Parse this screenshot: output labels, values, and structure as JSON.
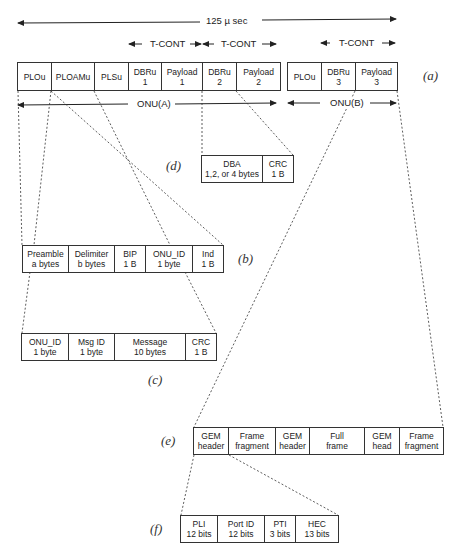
{
  "diagram": {
    "frame_duration_label": "125 µ sec",
    "tcont_label": "T-CONT",
    "onu_a_label": "ONU(A)",
    "onu_b_label": "ONU(B)",
    "parts": {
      "a": "(a)",
      "b": "(b)",
      "c": "(c)",
      "d": "(d)",
      "e": "(e)",
      "f": "(f)"
    },
    "row_a": {
      "onu_a_fields": [
        {
          "line1": "PLOu",
          "line2": ""
        },
        {
          "line1": "PLOAMu",
          "line2": ""
        },
        {
          "line1": "PLSu",
          "line2": ""
        },
        {
          "line1": "DBRu",
          "line2": "1"
        },
        {
          "line1": "Payload",
          "line2": "1"
        },
        {
          "line1": "DBRu",
          "line2": "2"
        },
        {
          "line1": "Payload",
          "line2": "2"
        }
      ],
      "onu_b_fields": [
        {
          "line1": "PLOu",
          "line2": ""
        },
        {
          "line1": "DBRu",
          "line2": "3"
        },
        {
          "line1": "Payload",
          "line2": "3"
        }
      ]
    },
    "row_b": [
      {
        "line1": "Preamble",
        "line2": "a bytes"
      },
      {
        "line1": "Delimiter",
        "line2": "b bytes"
      },
      {
        "line1": "BIP",
        "line2": "1 B"
      },
      {
        "line1": "ONU_ID",
        "line2": "1 byte"
      },
      {
        "line1": "Ind",
        "line2": "1 B"
      }
    ],
    "row_c": [
      {
        "line1": "ONU_ID",
        "line2": "1 byte"
      },
      {
        "line1": "Msg ID",
        "line2": "1 byte"
      },
      {
        "line1": "Message",
        "line2": "10  bytes"
      },
      {
        "line1": "CRC",
        "line2": "1 B"
      }
    ],
    "row_d": [
      {
        "line1": "DBA",
        "line2": "1,2, or 4 bytes"
      },
      {
        "line1": "CRC",
        "line2": "1 B"
      }
    ],
    "row_e": [
      {
        "line1": "GEM",
        "line2": "header"
      },
      {
        "line1": "Frame",
        "line2": "fragment"
      },
      {
        "line1": "GEM",
        "line2": "header"
      },
      {
        "line1": "Full",
        "line2": "frame"
      },
      {
        "line1": "GEM",
        "line2": "head"
      },
      {
        "line1": "Frame",
        "line2": "fragment"
      }
    ],
    "row_f": [
      {
        "line1": "PLI",
        "line2": "12 bits"
      },
      {
        "line1": "Port ID",
        "line2": "12 bits"
      },
      {
        "line1": "PTI",
        "line2": "3 bits"
      },
      {
        "line1": "HEC",
        "line2": "13 bits"
      }
    ]
  }
}
